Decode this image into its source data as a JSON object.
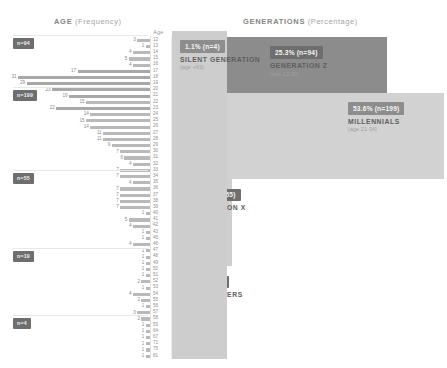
{
  "header": {
    "age_panel_title": "AGE",
    "age_panel_sub": "(Frequency)",
    "generations_panel_title": "GENERATIONS",
    "generations_panel_sub": "(Percentage)",
    "axis_caption": "Age"
  },
  "colors": {
    "badge": "#6e6e6e",
    "bar": "#b9b9b9",
    "gen_z": "#8c8c8c",
    "millennials": "#d2d2d2",
    "gen_x": "#cfcfcf",
    "baby_boomers": "#9a9a9a",
    "silent": "#cdcdcd",
    "text": "#5d5d5d",
    "muted": "#a0a0a0"
  },
  "chart_data": {
    "type": "bar",
    "xlabel": "Frequency",
    "ylabel": "Age",
    "orientation": "horizontal",
    "grid": false,
    "legend": "none",
    "total_n": 371,
    "categories": [
      12,
      13,
      14,
      15,
      16,
      17,
      18,
      19,
      20,
      21,
      22,
      23,
      24,
      25,
      26,
      27,
      28,
      29,
      30,
      31,
      32,
      33,
      34,
      35,
      36,
      37,
      38,
      39,
      40,
      41,
      42,
      43,
      45,
      46,
      47,
      48,
      49,
      50,
      51,
      52,
      53,
      54,
      55,
      56,
      57,
      58,
      59,
      64,
      67,
      71,
      75,
      81
    ],
    "values": [
      3,
      1,
      4,
      5,
      4,
      17,
      31,
      29,
      23,
      19,
      15,
      22,
      14,
      15,
      14,
      11,
      11,
      9,
      7,
      6,
      4,
      7,
      7,
      4,
      7,
      7,
      7,
      7,
      1,
      5,
      4,
      1,
      1,
      4,
      1,
      1,
      1,
      1,
      1,
      2,
      1,
      4,
      2,
      1,
      3,
      2,
      1,
      1,
      1,
      1,
      1,
      1
    ],
    "tick_labels": [
      "12",
      "13",
      "14",
      "15",
      "16",
      "17",
      "18",
      "19",
      "20",
      "21",
      "22",
      "23",
      "24",
      "25",
      "26",
      "27",
      "28",
      "29",
      "30",
      "31",
      "32",
      "33",
      "34",
      "35",
      "36",
      "37",
      "38",
      "39",
      "40",
      "41",
      "42",
      "43",
      "45",
      "46",
      "47",
      "48",
      "49",
      "50",
      "51",
      "52",
      "53",
      "54",
      "55",
      "56",
      "57",
      "58",
      "59",
      "64",
      "67",
      "71",
      "75",
      "81"
    ],
    "generations": [
      {
        "key": "gen_z",
        "pct": "25.3%",
        "count": "(n=94)",
        "name": "GENERATION Z",
        "age_range": "(age 12-20)",
        "pct_value": 25.3,
        "n": 94,
        "age_min": 12,
        "age_max": 20
      },
      {
        "key": "millennials",
        "pct": "53.6%",
        "count": "(n=199)",
        "name": "MILLENNIALS",
        "age_range": "(age 21-34)",
        "pct_value": 53.6,
        "n": 199,
        "age_min": 21,
        "age_max": 34
      },
      {
        "key": "gen_x",
        "pct": "14.8%",
        "count": "(n=55)",
        "name": "GENERATION X",
        "age_range": "(age 35-49)",
        "pct_value": 14.8,
        "n": 55,
        "age_min": 35,
        "age_max": 49
      },
      {
        "key": "baby_boomers",
        "pct": "5.1%",
        "count": "(n=19)",
        "name": "BABY BOOMERS",
        "age_range": "(age 50-64)",
        "pct_value": 5.1,
        "n": 19,
        "age_min": 50,
        "age_max": 64
      },
      {
        "key": "silent",
        "pct": "1.1%",
        "count": "(n=4)",
        "name": "SILENT GENERATION",
        "age_range": "(age +65)",
        "pct_value": 1.1,
        "n": 4,
        "age_min": 65,
        "age_max": null
      }
    ],
    "side_badges": [
      {
        "label": "n=94"
      },
      {
        "label": "n=199"
      },
      {
        "label": "n=55"
      },
      {
        "label": "n=19"
      },
      {
        "label": "n=4"
      }
    ]
  }
}
